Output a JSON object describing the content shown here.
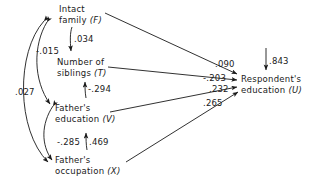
{
  "diagram": {
    "type": "path-diagram",
    "nodes": [
      {
        "id": "F",
        "line1": "Intact",
        "line2": "family",
        "symbol": "(F)"
      },
      {
        "id": "T",
        "line1": "Number of",
        "line2": "siblings",
        "symbol": "(T)"
      },
      {
        "id": "V",
        "line1": "Father's",
        "line2": "education",
        "symbol": "(V)"
      },
      {
        "id": "X",
        "line1": "Father's",
        "line2": "occupation",
        "symbol": "(X)"
      },
      {
        "id": "U",
        "line1": "Respondent's",
        "line2": "education",
        "symbol": "(U)"
      }
    ],
    "coefficients": [
      {
        "id": "c-034",
        "value": ".034",
        "from": "F",
        "to": "T",
        "kind": "path"
      },
      {
        "id": "c-294",
        "value": "-.294",
        "from": "V",
        "to": "T",
        "kind": "path"
      },
      {
        "id": "c-469",
        "value": ".469",
        "from": "X",
        "to": "V",
        "kind": "path"
      },
      {
        "id": "c-015",
        "value": "-.015",
        "from": "F",
        "to": "V",
        "kind": "correlation"
      },
      {
        "id": "c-285",
        "value": "-.285",
        "from": "V",
        "to": "X",
        "kind": "correlation"
      },
      {
        "id": "c-027",
        "value": ".027",
        "from": "F",
        "to": "X",
        "kind": "correlation"
      },
      {
        "id": "c-090",
        "value": ".090",
        "from": "F",
        "to": "U",
        "kind": "path"
      },
      {
        "id": "c-203",
        "value": "-.203",
        "from": "T",
        "to": "U",
        "kind": "path"
      },
      {
        "id": "c-232",
        "value": ".232",
        "from": "V",
        "to": "U",
        "kind": "path"
      },
      {
        "id": "c-265",
        "value": ".265",
        "from": "X",
        "to": "U",
        "kind": "path"
      },
      {
        "id": "c-843",
        "value": ".843",
        "from": "residual",
        "to": "U",
        "kind": "residual"
      }
    ],
    "colors": {
      "stroke": "#1a1a1a",
      "text": "#1a1a1a",
      "background": "#ffffff"
    }
  }
}
